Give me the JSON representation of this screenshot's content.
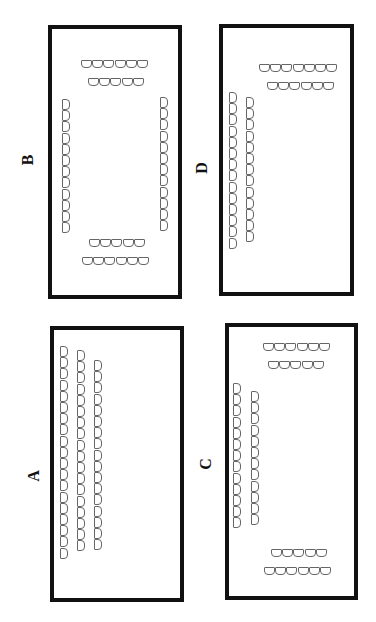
{
  "figure": {
    "panels": [
      {
        "id": "B",
        "label": "B",
        "seat_groups": [
          {
            "name": "top-row-outer",
            "orientation": "horizontal",
            "count": 6
          },
          {
            "name": "top-row-inner",
            "orientation": "horizontal",
            "count": 5
          },
          {
            "name": "left-column",
            "orientation": "vertical",
            "count": 12
          },
          {
            "name": "right-column",
            "orientation": "vertical",
            "count": 12
          },
          {
            "name": "bottom-row-inner",
            "orientation": "horizontal",
            "count": 5
          },
          {
            "name": "bottom-row-outer",
            "orientation": "horizontal",
            "count": 6
          }
        ]
      },
      {
        "id": "D",
        "label": "D",
        "seat_groups": [
          {
            "name": "top-row-outer",
            "orientation": "horizontal",
            "count": 7
          },
          {
            "name": "top-row-inner",
            "orientation": "horizontal",
            "count": 6
          },
          {
            "name": "left-column-outer",
            "orientation": "vertical",
            "count": 14
          },
          {
            "name": "left-column-inner",
            "orientation": "vertical",
            "count": 13
          }
        ]
      },
      {
        "id": "A",
        "label": "A",
        "seat_groups": [
          {
            "name": "column-1",
            "orientation": "vertical",
            "count": 19
          },
          {
            "name": "column-2",
            "orientation": "vertical",
            "count": 18
          },
          {
            "name": "column-3",
            "orientation": "vertical",
            "count": 17
          }
        ]
      },
      {
        "id": "C",
        "label": "C",
        "seat_groups": [
          {
            "name": "top-row-outer",
            "orientation": "horizontal",
            "count": 6
          },
          {
            "name": "top-row-inner",
            "orientation": "horizontal",
            "count": 5
          },
          {
            "name": "left-column-outer",
            "orientation": "vertical",
            "count": 13
          },
          {
            "name": "left-column-inner",
            "orientation": "vertical",
            "count": 12
          },
          {
            "name": "bottom-row-inner",
            "orientation": "horizontal",
            "count": 5
          },
          {
            "name": "bottom-row-outer",
            "orientation": "horizontal",
            "count": 6
          }
        ]
      }
    ]
  }
}
